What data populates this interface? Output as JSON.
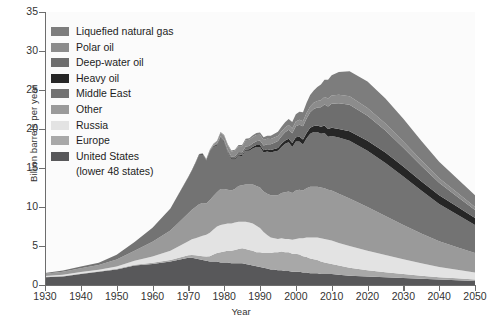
{
  "chart_data": {
    "type": "area",
    "stacked": true,
    "title": "",
    "xlabel": "Year",
    "ylabel": "Billion barrels per year",
    "xlim": [
      1930,
      2050
    ],
    "ylim": [
      0,
      35
    ],
    "xticks": [
      1930,
      1940,
      1950,
      1960,
      1970,
      1980,
      1990,
      2000,
      2010,
      2020,
      2030,
      2040,
      2050
    ],
    "yticks": [
      0,
      5,
      10,
      15,
      20,
      25,
      30,
      35
    ],
    "grid": false,
    "legend_position": "top-left",
    "x": [
      1930,
      1935,
      1940,
      1945,
      1950,
      1955,
      1960,
      1965,
      1970,
      1971,
      1972,
      1973,
      1974,
      1975,
      1976,
      1977,
      1978,
      1979,
      1980,
      1981,
      1982,
      1983,
      1984,
      1985,
      1986,
      1987,
      1988,
      1989,
      1990,
      1991,
      1992,
      1993,
      1994,
      1995,
      1996,
      1997,
      1998,
      1999,
      2000,
      2001,
      2002,
      2003,
      2004,
      2005,
      2006,
      2007,
      2008,
      2009,
      2010,
      2012,
      2015,
      2020,
      2025,
      2030,
      2035,
      2040,
      2045,
      2050
    ],
    "series": [
      {
        "name": "United  States",
        "sublabel": "(lower 48 states)",
        "color": "#58585a",
        "order": 1,
        "values": [
          1.0,
          1.1,
          1.4,
          1.7,
          2.0,
          2.5,
          2.7,
          3.0,
          3.5,
          3.5,
          3.4,
          3.3,
          3.2,
          3.1,
          3.0,
          3.0,
          3.0,
          2.9,
          2.9,
          2.9,
          2.8,
          2.8,
          2.8,
          2.8,
          2.7,
          2.6,
          2.5,
          2.4,
          2.3,
          2.2,
          2.1,
          2.0,
          2.0,
          1.9,
          1.9,
          1.8,
          1.8,
          1.7,
          1.7,
          1.7,
          1.6,
          1.6,
          1.5,
          1.5,
          1.5,
          1.4,
          1.4,
          1.4,
          1.4,
          1.3,
          1.2,
          1.1,
          1.0,
          0.9,
          0.8,
          0.7,
          0.6,
          0.5
        ]
      },
      {
        "name": "Europe",
        "color": "#a8a8a8",
        "order": 2,
        "values": [
          0.05,
          0.05,
          0.06,
          0.06,
          0.07,
          0.1,
          0.15,
          0.2,
          0.3,
          0.35,
          0.4,
          0.45,
          0.5,
          0.55,
          0.7,
          0.9,
          1.1,
          1.3,
          1.4,
          1.5,
          1.6,
          1.7,
          1.8,
          1.9,
          1.9,
          1.9,
          1.9,
          1.8,
          1.9,
          1.9,
          2.0,
          2.1,
          2.2,
          2.3,
          2.4,
          2.4,
          2.4,
          2.3,
          2.3,
          2.2,
          2.1,
          2.0,
          1.9,
          1.8,
          1.7,
          1.6,
          1.5,
          1.4,
          1.3,
          1.2,
          1.0,
          0.8,
          0.65,
          0.5,
          0.4,
          0.3,
          0.25,
          0.2
        ]
      },
      {
        "name": "Russia",
        "color": "#e3e3e3",
        "order": 3,
        "values": [
          0.1,
          0.15,
          0.2,
          0.2,
          0.3,
          0.5,
          0.8,
          1.2,
          1.8,
          2.0,
          2.2,
          2.4,
          2.6,
          2.8,
          3.0,
          3.2,
          3.4,
          3.5,
          3.5,
          3.5,
          3.5,
          3.5,
          3.5,
          3.4,
          3.5,
          3.5,
          3.5,
          3.4,
          3.1,
          2.7,
          2.3,
          2.0,
          1.8,
          1.7,
          1.7,
          1.7,
          1.7,
          1.8,
          1.9,
          2.1,
          2.3,
          2.5,
          2.7,
          2.8,
          2.9,
          3.0,
          3.0,
          3.0,
          3.0,
          2.9,
          2.8,
          2.5,
          2.2,
          1.9,
          1.6,
          1.3,
          1.1,
          0.9
        ]
      },
      {
        "name": "Other",
        "color": "#9a9a9a",
        "order": 4,
        "values": [
          0.3,
          0.4,
          0.5,
          0.6,
          0.9,
          1.3,
          1.9,
          2.6,
          3.6,
          3.8,
          4.0,
          4.2,
          4.2,
          4.0,
          4.2,
          4.3,
          4.4,
          4.6,
          4.5,
          4.3,
          4.2,
          4.3,
          4.6,
          4.7,
          4.8,
          4.9,
          5.0,
          5.1,
          5.2,
          5.2,
          5.3,
          5.4,
          5.5,
          5.6,
          5.8,
          6.0,
          6.1,
          6.0,
          6.2,
          6.2,
          6.1,
          6.3,
          6.5,
          6.5,
          6.5,
          6.5,
          6.5,
          6.4,
          6.4,
          6.3,
          6.1,
          5.6,
          5.0,
          4.4,
          3.8,
          3.3,
          2.9,
          2.5
        ]
      },
      {
        "name": "Middle East",
        "color": "#737373",
        "order": 5,
        "values": [
          0.1,
          0.15,
          0.2,
          0.3,
          0.6,
          1.1,
          1.8,
          2.8,
          4.6,
          5.0,
          5.6,
          6.3,
          6.2,
          5.5,
          6.2,
          6.3,
          6.0,
          6.5,
          6.0,
          4.8,
          4.0,
          3.8,
          3.9,
          3.7,
          4.3,
          4.3,
          4.6,
          5.0,
          5.2,
          5.0,
          5.4,
          5.5,
          5.6,
          5.7,
          5.9,
          6.2,
          6.3,
          5.9,
          6.3,
          6.2,
          5.9,
          6.4,
          6.8,
          7.0,
          7.0,
          6.9,
          7.1,
          6.8,
          7.0,
          7.2,
          7.4,
          7.2,
          6.8,
          6.2,
          5.5,
          4.8,
          4.2,
          3.6
        ]
      },
      {
        "name": "Heavy oil",
        "color": "#262626",
        "order": 6,
        "values": [
          0,
          0,
          0,
          0,
          0,
          0,
          0,
          0.02,
          0.05,
          0.05,
          0.06,
          0.07,
          0.08,
          0.08,
          0.09,
          0.1,
          0.11,
          0.12,
          0.12,
          0.13,
          0.14,
          0.15,
          0.16,
          0.17,
          0.18,
          0.2,
          0.22,
          0.24,
          0.26,
          0.28,
          0.3,
          0.32,
          0.35,
          0.38,
          0.4,
          0.43,
          0.46,
          0.5,
          0.55,
          0.6,
          0.65,
          0.7,
          0.75,
          0.8,
          0.85,
          0.9,
          0.95,
          1.0,
          1.05,
          1.1,
          1.2,
          1.3,
          1.35,
          1.3,
          1.2,
          1.1,
          1.0,
          0.9
        ]
      },
      {
        "name": "Deep-water oil",
        "color": "#6e6e6e",
        "order": 7,
        "values": [
          0,
          0,
          0,
          0,
          0,
          0,
          0,
          0,
          0.02,
          0.03,
          0.04,
          0.05,
          0.06,
          0.07,
          0.08,
          0.1,
          0.12,
          0.15,
          0.18,
          0.2,
          0.23,
          0.26,
          0.3,
          0.34,
          0.38,
          0.42,
          0.46,
          0.5,
          0.55,
          0.6,
          0.66,
          0.72,
          0.8,
          0.88,
          0.96,
          1.05,
          1.15,
          1.25,
          1.4,
          1.55,
          1.7,
          1.85,
          2.0,
          2.15,
          2.3,
          2.5,
          2.7,
          2.9,
          3.1,
          3.3,
          3.4,
          3.2,
          2.8,
          2.4,
          2.0,
          1.6,
          1.3,
          1.0
        ]
      },
      {
        "name": "Polar oil",
        "color": "#8c8c8c",
        "order": 8,
        "values": [
          0,
          0,
          0,
          0,
          0,
          0,
          0,
          0,
          0,
          0,
          0,
          0,
          0,
          0.02,
          0.05,
          0.15,
          0.3,
          0.45,
          0.55,
          0.6,
          0.65,
          0.7,
          0.75,
          0.78,
          0.8,
          0.8,
          0.8,
          0.78,
          0.75,
          0.72,
          0.7,
          0.68,
          0.66,
          0.64,
          0.62,
          0.6,
          0.6,
          0.6,
          0.6,
          0.62,
          0.65,
          0.7,
          0.75,
          0.8,
          0.85,
          0.9,
          0.95,
          1.0,
          1.05,
          1.1,
          1.1,
          1.0,
          0.9,
          0.8,
          0.7,
          0.6,
          0.5,
          0.4
        ]
      },
      {
        "name": "Liquefied natural gas",
        "color": "#7d7d7d",
        "order": 9,
        "values": [
          0,
          0,
          0,
          0,
          0,
          0,
          0,
          0,
          0.02,
          0.02,
          0.03,
          0.03,
          0.04,
          0.04,
          0.05,
          0.06,
          0.07,
          0.08,
          0.09,
          0.1,
          0.11,
          0.12,
          0.14,
          0.16,
          0.18,
          0.2,
          0.23,
          0.26,
          0.3,
          0.34,
          0.38,
          0.43,
          0.48,
          0.54,
          0.6,
          0.68,
          0.76,
          0.85,
          0.95,
          1.05,
          1.15,
          1.3,
          1.45,
          1.6,
          1.8,
          2.0,
          2.2,
          2.4,
          2.6,
          2.9,
          3.2,
          3.4,
          3.2,
          2.9,
          2.5,
          2.1,
          1.8,
          1.5
        ]
      }
    ]
  },
  "legend": {
    "items": [
      {
        "label": "Liquefied natural gas",
        "color": "#7d7d7d"
      },
      {
        "label": "Polar oil",
        "color": "#8c8c8c"
      },
      {
        "label": "Deep-water oil",
        "color": "#6e6e6e"
      },
      {
        "label": "Heavy oil",
        "color": "#262626"
      },
      {
        "label": "Middle East",
        "color": "#737373"
      },
      {
        "label": "Other",
        "color": "#9a9a9a"
      },
      {
        "label": "Russia",
        "color": "#e3e3e3"
      },
      {
        "label": "Europe",
        "color": "#a8a8a8"
      },
      {
        "label": "United  States",
        "color": "#58585a",
        "sublabel": "(lower 48 states)"
      }
    ]
  },
  "axes": {
    "y_label": "Billion barrels per year",
    "x_label": "Year",
    "y_ticks": [
      "0",
      "5",
      "10",
      "15",
      "20",
      "25",
      "30",
      "35"
    ],
    "x_ticks": [
      "1930",
      "1940",
      "1950",
      "1960",
      "1970",
      "1980",
      "1990",
      "2000",
      "2010",
      "2020",
      "2030",
      "2040",
      "2050"
    ]
  },
  "colors": {
    "plot_background": "#fbfbfb",
    "axis": "#6d6d6d",
    "text": "#333333"
  }
}
